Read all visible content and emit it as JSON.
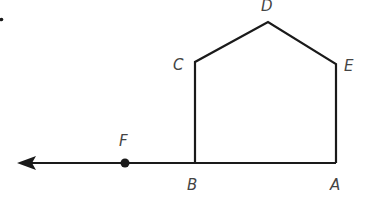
{
  "diagram": {
    "type": "geometry-figure",
    "stroke_color": "#1a1a1a",
    "label_color": "#444444",
    "stray_mark": ".",
    "points": {
      "A": {
        "label": "A",
        "x": 336,
        "y": 163
      },
      "B": {
        "label": "B",
        "x": 195,
        "y": 163
      },
      "C": {
        "label": "C",
        "x": 195,
        "y": 62
      },
      "D": {
        "label": "D",
        "x": 268,
        "y": 22
      },
      "E": {
        "label": "E",
        "x": 336,
        "y": 64
      },
      "F": {
        "label": "F",
        "x": 125,
        "y": 163
      }
    },
    "pentagon": [
      "A",
      "B",
      "C",
      "D",
      "E"
    ],
    "ray": {
      "from": "A",
      "through": [
        "B",
        "F"
      ],
      "direction": "left",
      "arrow_tip_x": 17
    },
    "labels": {
      "A": "A",
      "B": "B",
      "C": "C",
      "D": "D",
      "E": "E",
      "F": "F"
    }
  }
}
